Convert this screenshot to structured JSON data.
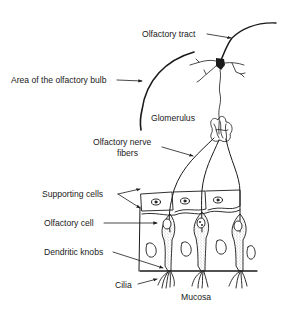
{
  "figure": {
    "labels": {
      "olfactory_tract": "Olfactory tract",
      "olfactory_bulb": "Area of the olfactory bulb",
      "glomerulus": "Glomerulus",
      "nerve_fibers_line1": "Olfactory nerve",
      "nerve_fibers_line2": "fibers",
      "supporting_cells": "Supporting cells",
      "olfactory_cell": "Olfactory cell",
      "dendritic_knobs": "Dendritic knobs",
      "cilia": "Cilia",
      "mucosa": "Mucosa"
    },
    "colors": {
      "ink": "#1a1a1a",
      "background": "#ffffff",
      "stipple": "#6a6a6a"
    }
  }
}
